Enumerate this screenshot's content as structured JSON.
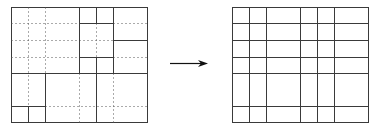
{
  "figure": {
    "colors": {
      "line": "#3a3a3a",
      "dotted": "#555555",
      "arrow": "#111111",
      "background": "#ffffff"
    }
  },
  "left_grid": {
    "bounds": {
      "x0": 11,
      "y0": 7,
      "x1": 147,
      "y1": 122
    },
    "solid_segments": [
      [
        79,
        7,
        79,
        73
      ],
      [
        96,
        7,
        96,
        23
      ],
      [
        96,
        57,
        96,
        122
      ],
      [
        113,
        7,
        113,
        73
      ],
      [
        11,
        73,
        147,
        73
      ],
      [
        79,
        23,
        113,
        23
      ],
      [
        79,
        57,
        113,
        57
      ],
      [
        113,
        40,
        147,
        40
      ],
      [
        45,
        73,
        45,
        122
      ],
      [
        11,
        106,
        45,
        106
      ],
      [
        28,
        106,
        28,
        122
      ]
    ],
    "dotted_segments": [
      [
        28,
        7,
        28,
        106
      ],
      [
        45,
        7,
        45,
        73
      ],
      [
        11,
        23,
        79,
        23
      ],
      [
        113,
        23,
        147,
        23
      ],
      [
        11,
        40,
        113,
        40
      ],
      [
        11,
        57,
        79,
        57
      ],
      [
        113,
        57,
        147,
        57
      ],
      [
        96,
        23,
        96,
        57
      ],
      [
        79,
        73,
        79,
        122
      ],
      [
        113,
        73,
        113,
        122
      ],
      [
        45,
        106,
        147,
        106
      ]
    ]
  },
  "arrow": {
    "x1": 170,
    "y1": 63,
    "x2": 208,
    "y2": 63,
    "direction": "right"
  },
  "right_grid": {
    "bounds": {
      "x0": 232,
      "y0": 7,
      "x1": 368,
      "y1": 122
    },
    "vertical_lines": [
      249,
      266,
      300,
      317,
      334
    ],
    "horizontal_lines": [
      23,
      40,
      57,
      73,
      106
    ]
  }
}
